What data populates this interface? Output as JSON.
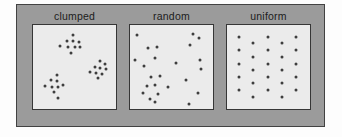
{
  "figure": {
    "colors": {
      "page_background": "#fdfdfd",
      "frame_fill": "#9b9b9b",
      "frame_border": "#424242",
      "panel_fill": "#ebebeb",
      "panel_border": "#363636",
      "dot": "#3e3e3e",
      "label_text": "#1c1c1c"
    }
  },
  "panels": [
    {
      "label": "clumped",
      "dots": [
        [
          48.6,
          12.0
        ],
        [
          40.8,
          19.4
        ],
        [
          48.6,
          19.4
        ],
        [
          55.3,
          20.6
        ],
        [
          32.1,
          25.2
        ],
        [
          42.7,
          26.4
        ],
        [
          50.2,
          26.7
        ],
        [
          56.5,
          25.6
        ],
        [
          46.2,
          32.9
        ],
        [
          81.2,
          42.7
        ],
        [
          87.1,
          46.5
        ],
        [
          74.1,
          49.7
        ],
        [
          81.2,
          51.2
        ],
        [
          87.4,
          52.0
        ],
        [
          69.1,
          55.5
        ],
        [
          76.1,
          56.6
        ],
        [
          82.7,
          57.8
        ],
        [
          78.0,
          62.8
        ],
        [
          28.6,
          59.0
        ],
        [
          22.0,
          65.9
        ],
        [
          29.4,
          66.6
        ],
        [
          14.9,
          72.4
        ],
        [
          22.7,
          73.6
        ],
        [
          29.8,
          73.6
        ],
        [
          35.6,
          71.7
        ],
        [
          25.9,
          79.9
        ],
        [
          30.6,
          86.9
        ]
      ]
    },
    {
      "label": "random",
      "dots": [
        [
          8.9,
          11.6
        ],
        [
          76.2,
          11.0
        ],
        [
          83.3,
          15.7
        ],
        [
          72.6,
          23.8
        ],
        [
          32.7,
          26.2
        ],
        [
          22.0,
          27.9
        ],
        [
          30.4,
          39.0
        ],
        [
          6.0,
          41.9
        ],
        [
          83.9,
          41.9
        ],
        [
          55.4,
          44.8
        ],
        [
          17.3,
          48.8
        ],
        [
          85.1,
          52.9
        ],
        [
          36.3,
          60.5
        ],
        [
          25.6,
          61.6
        ],
        [
          67.3,
          65.7
        ],
        [
          29.8,
          71.5
        ],
        [
          20.8,
          72.1
        ],
        [
          45.8,
          74.4
        ],
        [
          15.5,
          81.4
        ],
        [
          33.9,
          82.6
        ],
        [
          81.5,
          81.4
        ],
        [
          24.4,
          87.8
        ],
        [
          29.8,
          91.9
        ],
        [
          70.8,
          93.6
        ]
      ]
    },
    {
      "label": "uniform",
      "dots": [
        [
          14.9,
          14.1
        ],
        [
          14.9,
          30.0
        ],
        [
          14.9,
          45.9
        ],
        [
          14.9,
          61.8
        ],
        [
          14.9,
          77.6
        ],
        [
          31.5,
          21.8
        ],
        [
          31.5,
          37.6
        ],
        [
          31.5,
          53.5
        ],
        [
          31.5,
          69.4
        ],
        [
          31.5,
          85.9
        ],
        [
          49.4,
          14.1
        ],
        [
          49.4,
          30.0
        ],
        [
          49.4,
          45.9
        ],
        [
          49.4,
          61.8
        ],
        [
          49.4,
          77.6
        ],
        [
          66.1,
          21.8
        ],
        [
          66.1,
          37.6
        ],
        [
          66.1,
          53.5
        ],
        [
          66.1,
          69.4
        ],
        [
          66.1,
          85.9
        ],
        [
          83.3,
          14.1
        ],
        [
          83.3,
          30.0
        ],
        [
          83.3,
          45.9
        ],
        [
          83.3,
          61.8
        ],
        [
          83.3,
          77.6
        ]
      ]
    }
  ]
}
